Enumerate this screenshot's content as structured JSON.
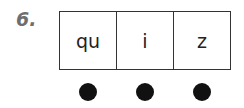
{
  "item_number": "6.",
  "boxes": [
    {
      "sound": "qu"
    },
    {
      "sound": "i"
    },
    {
      "sound": "z"
    }
  ],
  "dot_count": 3
}
